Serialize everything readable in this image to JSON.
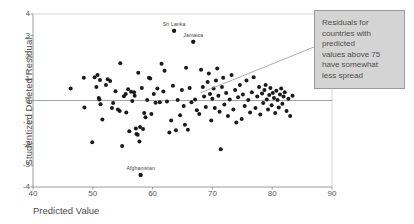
{
  "chart_data": {
    "type": "scatter",
    "title": "",
    "xlabel": "Predicted Value",
    "ylabel": "Studentized Deleted Residual",
    "xlim": [
      40,
      90
    ],
    "ylim": [
      -4,
      4
    ],
    "xticks": [
      "40",
      "50",
      "60",
      "70",
      "80",
      "90"
    ],
    "xtick_values": [
      40,
      50,
      60,
      70,
      80,
      90
    ],
    "yticks": [
      "4",
      "3",
      "2",
      "1",
      "0",
      "-1",
      "-2",
      "-3",
      "-4"
    ],
    "ytick_values": [
      4,
      3,
      2,
      1,
      0,
      -1,
      -2,
      -3,
      -4
    ],
    "grid": false,
    "reference_line": {
      "axis": "y",
      "value": 0,
      "color": "#9a9a9a"
    },
    "legend": null,
    "marker": {
      "shape": "circle",
      "color": "#1a1a1a",
      "size": 2.0
    },
    "points": [
      [
        46.3,
        0.55
      ],
      [
        48.5,
        1.05
      ],
      [
        48.6,
        -0.32
      ],
      [
        49.9,
        -1.93
      ],
      [
        50.3,
        1.08
      ],
      [
        50.6,
        0.62
      ],
      [
        50.8,
        1.18
      ],
      [
        51.2,
        0.95
      ],
      [
        51.0,
        0.12
      ],
      [
        51.1,
        0.05
      ],
      [
        51.3,
        -0.17
      ],
      [
        51.6,
        -0.88
      ],
      [
        52.2,
        0.72
      ],
      [
        52.5,
        0.98
      ],
      [
        52.9,
        0.9
      ],
      [
        53.4,
        -0.12
      ],
      [
        53.2,
        -0.35
      ],
      [
        53.8,
        0.43
      ],
      [
        54.2,
        -0.42
      ],
      [
        54.5,
        -0.48
      ],
      [
        54.6,
        1.72
      ],
      [
        54.9,
        -2.1
      ],
      [
        55.2,
        0.2
      ],
      [
        55.5,
        0.3
      ],
      [
        55.6,
        -0.55
      ],
      [
        55.9,
        0.52
      ],
      [
        56.1,
        -1.42
      ],
      [
        56.4,
        0.4
      ],
      [
        56.6,
        -0.02
      ],
      [
        56.9,
        0.38
      ],
      [
        57.0,
        0.22
      ],
      [
        57.2,
        -1.3
      ],
      [
        57.3,
        -1.55
      ],
      [
        57.5,
        -1.58
      ],
      [
        57.6,
        1.28
      ],
      [
        57.8,
        -1.9
      ],
      [
        57.9,
        -1.22
      ],
      [
        58.0,
        -3.45
      ],
      [
        58.2,
        0.58
      ],
      [
        58.4,
        -1.32
      ],
      [
        58.6,
        -0.58
      ],
      [
        58.8,
        -0.78
      ],
      [
        59.1,
        0.02
      ],
      [
        59.4,
        1.05
      ],
      [
        59.6,
        1.02
      ],
      [
        59.8,
        -0.62
      ],
      [
        60.2,
        0.3
      ],
      [
        60.5,
        -0.1
      ],
      [
        60.8,
        0.55
      ],
      [
        61.2,
        -0.08
      ],
      [
        61.5,
        1.7
      ],
      [
        61.8,
        0.42
      ],
      [
        62.0,
        1.38
      ],
      [
        62.4,
        -0.05
      ],
      [
        62.8,
        -1.48
      ],
      [
        63.1,
        -0.92
      ],
      [
        63.4,
        0.68
      ],
      [
        63.6,
        3.22
      ],
      [
        63.9,
        -1.38
      ],
      [
        64.2,
        0.02
      ],
      [
        64.6,
        -0.68
      ],
      [
        64.9,
        0.48
      ],
      [
        65.2,
        -0.25
      ],
      [
        65.4,
        -1.12
      ],
      [
        65.6,
        1.52
      ],
      [
        65.9,
        -1.35
      ],
      [
        66.2,
        0.58
      ],
      [
        66.5,
        -0.08
      ],
      [
        66.8,
        2.72
      ],
      [
        67.1,
        0.05
      ],
      [
        67.4,
        -0.45
      ],
      [
        67.8,
        -0.62
      ],
      [
        68.1,
        1.42
      ],
      [
        68.4,
        0.62
      ],
      [
        68.6,
        0.18
      ],
      [
        68.9,
        -0.3
      ],
      [
        69.2,
        0.85
      ],
      [
        69.4,
        1.25
      ],
      [
        69.6,
        0.3
      ],
      [
        69.8,
        -0.92
      ],
      [
        70.0,
        0.08
      ],
      [
        70.2,
        0.55
      ],
      [
        70.4,
        -0.35
      ],
      [
        70.6,
        0.92
      ],
      [
        70.8,
        1.48
      ],
      [
        71.0,
        0.22
      ],
      [
        71.2,
        -0.52
      ],
      [
        71.4,
        -2.25
      ],
      [
        71.6,
        0.62
      ],
      [
        71.8,
        1.05
      ],
      [
        72.0,
        -0.18
      ],
      [
        72.3,
        0.35
      ],
      [
        72.6,
        -0.72
      ],
      [
        72.9,
        0.05
      ],
      [
        73.2,
        1.18
      ],
      [
        73.5,
        -0.42
      ],
      [
        73.8,
        0.48
      ],
      [
        74.0,
        -1.02
      ],
      [
        74.3,
        0.15
      ],
      [
        74.6,
        0.72
      ],
      [
        74.9,
        -0.85
      ],
      [
        75.1,
        0.28
      ],
      [
        75.4,
        -0.25
      ],
      [
        75.7,
        0.92
      ],
      [
        76.0,
        0.02
      ],
      [
        76.3,
        -0.55
      ],
      [
        76.6,
        0.38
      ],
      [
        76.9,
        1.08
      ],
      [
        77.2,
        -0.35
      ],
      [
        77.5,
        0.18
      ],
      [
        77.8,
        0.62
      ],
      [
        78.0,
        -0.65
      ],
      [
        78.3,
        0.32
      ],
      [
        78.5,
        -0.12
      ],
      [
        78.7,
        0.48
      ],
      [
        78.9,
        0.72
      ],
      [
        79.1,
        0.05
      ],
      [
        79.3,
        -0.42
      ],
      [
        79.5,
        0.25
      ],
      [
        79.7,
        0.58
      ],
      [
        79.9,
        -0.22
      ],
      [
        80.1,
        0.35
      ],
      [
        80.3,
        0.12
      ],
      [
        80.5,
        -0.58
      ],
      [
        80.7,
        0.45
      ],
      [
        80.9,
        0.02
      ],
      [
        81.1,
        -0.32
      ],
      [
        81.3,
        0.28
      ],
      [
        81.5,
        0.55
      ],
      [
        81.7,
        -0.15
      ],
      [
        81.9,
        0.18
      ],
      [
        82.1,
        0.38
      ],
      [
        82.4,
        -0.48
      ],
      [
        82.7,
        0.08
      ],
      [
        83.0,
        -0.72
      ],
      [
        83.4,
        0.22
      ]
    ],
    "annotated_points": [
      {
        "label": "Sri Lanka",
        "x": 63.6,
        "y": 3.22
      },
      {
        "label": "Jamaica",
        "x": 66.8,
        "y": 2.72
      },
      {
        "label": "Afghanistan",
        "x": 58.0,
        "y": -3.45
      }
    ],
    "annotations": [
      {
        "id": "spread-callout",
        "text": "Residuals for countries with predicted values above 75 have somewhat less spread",
        "lines": [
          "Residuals for",
          "countries with",
          "predicted",
          "values above 75",
          "have somewhat",
          "less spread"
        ],
        "box_color": "#d4d4d4",
        "border_color": "#9a9a9a",
        "leader_from": {
          "x": 68.0,
          "y": 0.35
        }
      }
    ]
  }
}
